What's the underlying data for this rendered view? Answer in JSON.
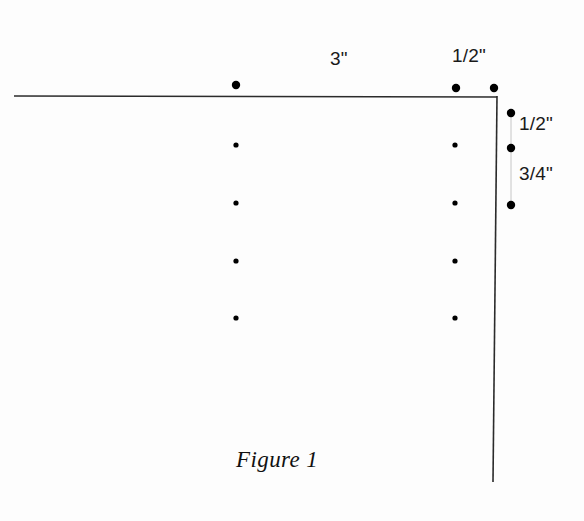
{
  "figure": {
    "caption": "Figure 1",
    "caption_x": 236,
    "caption_y": 447,
    "background_color": "#fdfdfd",
    "line_color": "#2b2b2b",
    "dot_color": "#000000"
  },
  "outline": {
    "description": "L-shaped corner profile drawn as two straight strokes",
    "stroke_width": 1.6,
    "horizontal_edge": {
      "x1": 14,
      "y1": 96,
      "x2": 497,
      "y2": 97
    },
    "vertical_edge": {
      "x1": 497,
      "y1": 96,
      "x2": 493,
      "y2": 482
    }
  },
  "dimension_labels": [
    {
      "id": "top-span-3in",
      "text": "3\"",
      "x": 330,
      "y": 48
    },
    {
      "id": "top-span-half",
      "text": "1/2\"",
      "x": 452,
      "y": 45
    },
    {
      "id": "side-span-half",
      "text": "1/2\"",
      "x": 519,
      "y": 113
    },
    {
      "id": "side-span-three-quarter",
      "text": "3/4\"",
      "x": 519,
      "y": 163
    }
  ],
  "hole_markers": {
    "top_edge": {
      "note": "large filled dots above the horizontal edge",
      "radius": 4.2,
      "points": [
        {
          "cx": 236,
          "cy": 85
        },
        {
          "cx": 456,
          "cy": 88
        },
        {
          "cx": 494,
          "cy": 88
        }
      ]
    },
    "right_edge": {
      "note": "large filled dots right of the vertical edge",
      "radius": 4.2,
      "points": [
        {
          "cx": 511,
          "cy": 113
        },
        {
          "cx": 511,
          "cy": 148
        },
        {
          "cx": 511,
          "cy": 205
        }
      ]
    },
    "interior_grid": {
      "note": "small filled dots inside the profile, 2 columns by 4 rows",
      "radius": 2.6,
      "columns": [
        236,
        455
      ],
      "rows": [
        145,
        203,
        261,
        318
      ]
    }
  },
  "dimension_ticks": {
    "note": "faint leader line joining the upper pair of right-edge dots",
    "stroke_width": 0.8,
    "color": "#b8b8b8",
    "segments": [
      {
        "x1": 511,
        "y1": 117,
        "x2": 511,
        "y2": 144
      },
      {
        "x1": 511,
        "y1": 152,
        "x2": 511,
        "y2": 201
      }
    ]
  }
}
